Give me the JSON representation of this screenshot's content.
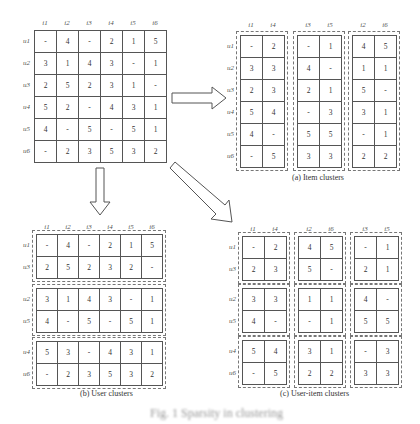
{
  "main_matrix": {
    "col_labels": [
      "i1",
      "i2",
      "i3",
      "i4",
      "i5",
      "i6"
    ],
    "row_labels": [
      "u1",
      "u2",
      "u3",
      "u4",
      "u5",
      "u6"
    ],
    "rows": [
      [
        "-",
        "4",
        "-",
        "2",
        "1",
        "5"
      ],
      [
        "3",
        "1",
        "4",
        "3",
        "-",
        "1"
      ],
      [
        "2",
        "5",
        "2",
        "3",
        "1",
        "-"
      ],
      [
        "5",
        "2",
        "-",
        "4",
        "3",
        "1"
      ],
      [
        "4",
        "-",
        "5",
        "-",
        "5",
        "1"
      ],
      [
        "-",
        "2",
        "3",
        "5",
        "3",
        "2"
      ]
    ]
  },
  "item_clusters": {
    "caption": "(a) Item clusters",
    "row_labels": [
      "u1",
      "u2",
      "u3",
      "u4",
      "u5",
      "u6"
    ],
    "clusters": [
      {
        "cols": [
          "i1",
          "i4"
        ],
        "rows": [
          [
            "-",
            "2"
          ],
          [
            "3",
            "3"
          ],
          [
            "2",
            "3"
          ],
          [
            "5",
            "4"
          ],
          [
            "4",
            "-"
          ],
          [
            "-",
            "5"
          ]
        ]
      },
      {
        "cols": [
          "i3",
          "i5"
        ],
        "rows": [
          [
            "-",
            "1"
          ],
          [
            "4",
            "-"
          ],
          [
            "2",
            "1"
          ],
          [
            "-",
            "3"
          ],
          [
            "5",
            "5"
          ],
          [
            "3",
            "3"
          ]
        ]
      },
      {
        "cols": [
          "i2",
          "i6"
        ],
        "rows": [
          [
            "4",
            "5"
          ],
          [
            "1",
            "1"
          ],
          [
            "5",
            "-"
          ],
          [
            "3",
            "1"
          ],
          [
            "-",
            "1"
          ],
          [
            "2",
            "2"
          ]
        ]
      }
    ]
  },
  "user_clusters": {
    "caption": "(b) User clusters",
    "col_labels": [
      "i1",
      "i2",
      "i3",
      "i4",
      "i5",
      "i6"
    ],
    "clusters": [
      {
        "rows_labels": [
          "u1",
          "u3"
        ],
        "rows": [
          [
            "-",
            "4",
            "-",
            "2",
            "1",
            "5"
          ],
          [
            "2",
            "5",
            "2",
            "3",
            "2",
            "-"
          ]
        ]
      },
      {
        "rows_labels": [
          "u2",
          "u5"
        ],
        "rows": [
          [
            "3",
            "1",
            "4",
            "3",
            "-",
            "1"
          ],
          [
            "4",
            "-",
            "5",
            "-",
            "5",
            "1"
          ]
        ]
      },
      {
        "rows_labels": [
          "u4",
          "u6"
        ],
        "rows": [
          [
            "5",
            "3",
            "-",
            "4",
            "3",
            "1"
          ],
          [
            "-",
            "2",
            "3",
            "5",
            "3",
            "2"
          ]
        ]
      }
    ]
  },
  "user_item_clusters": {
    "caption": "(c) User-item clusters",
    "col_groups": [
      [
        "i1",
        "i4"
      ],
      [
        "i2",
        "i6"
      ],
      [
        "i3",
        "i5"
      ]
    ],
    "row_groups": [
      [
        "u1",
        "u3"
      ],
      [
        "u2",
        "u5"
      ],
      [
        "u4",
        "u6"
      ]
    ],
    "blocks": [
      [
        [
          [
            "-",
            "2"
          ],
          [
            "2",
            "3"
          ]
        ],
        [
          [
            "4",
            "5"
          ],
          [
            "5",
            "-"
          ]
        ],
        [
          [
            "-",
            "1"
          ],
          [
            "2",
            "1"
          ]
        ]
      ],
      [
        [
          [
            "3",
            "3"
          ],
          [
            "4",
            "-"
          ]
        ],
        [
          [
            "1",
            "1"
          ],
          [
            "-",
            "1"
          ]
        ],
        [
          [
            "4",
            "-"
          ],
          [
            "5",
            "5"
          ]
        ]
      ],
      [
        [
          [
            "5",
            "4"
          ],
          [
            "-",
            "5"
          ]
        ],
        [
          [
            "3",
            "1"
          ],
          [
            "2",
            "2"
          ]
        ],
        [
          [
            "-",
            "3"
          ],
          [
            "3",
            "3"
          ]
        ]
      ]
    ]
  },
  "figure_caption": "Fig. 1  Sparsity in clustering"
}
